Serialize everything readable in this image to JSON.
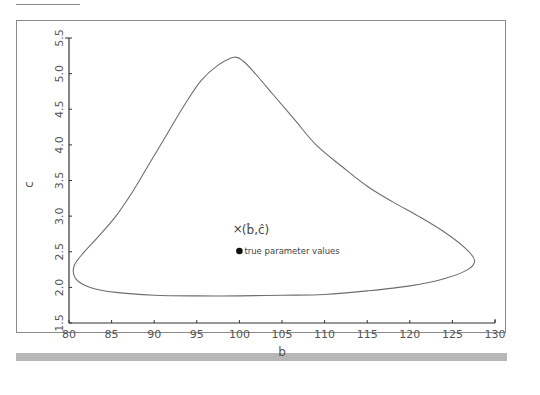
{
  "chart_data": {
    "type": "line",
    "title": "",
    "xlabel": "b",
    "ylabel": "c",
    "xlim": [
      80,
      130
    ],
    "ylim": [
      1.5,
      5.5
    ],
    "x_ticks": [
      "80",
      "85",
      "90",
      "95",
      "100",
      "105",
      "110",
      "115",
      "120",
      "125",
      "130"
    ],
    "y_ticks": [
      "1.5",
      "2.0",
      "2.5",
      "3.0",
      "3.5",
      "4.0",
      "4.5",
      "5.0",
      "5.5"
    ],
    "grid": false,
    "legend": "none",
    "series": [
      {
        "name": "confidence region",
        "kind": "closed-contour",
        "points": [
          [
            99.4,
            5.23
          ],
          [
            97.5,
            5.12
          ],
          [
            95.5,
            4.9
          ],
          [
            93.5,
            4.55
          ],
          [
            91.5,
            4.15
          ],
          [
            89.5,
            3.75
          ],
          [
            87.5,
            3.35
          ],
          [
            85.5,
            3.0
          ],
          [
            83.5,
            2.72
          ],
          [
            81.8,
            2.5
          ],
          [
            80.6,
            2.3
          ],
          [
            80.8,
            2.12
          ],
          [
            82.5,
            2.0
          ],
          [
            85.5,
            1.93
          ],
          [
            90.0,
            1.89
          ],
          [
            95.0,
            1.88
          ],
          [
            100.0,
            1.88
          ],
          [
            105.0,
            1.89
          ],
          [
            110.0,
            1.9
          ],
          [
            115.0,
            1.95
          ],
          [
            120.0,
            2.02
          ],
          [
            124.0,
            2.12
          ],
          [
            126.8,
            2.25
          ],
          [
            127.6,
            2.38
          ],
          [
            126.5,
            2.55
          ],
          [
            124.0,
            2.78
          ],
          [
            121.0,
            3.0
          ],
          [
            118.0,
            3.2
          ],
          [
            115.0,
            3.42
          ],
          [
            112.0,
            3.7
          ],
          [
            109.0,
            4.0
          ],
          [
            106.5,
            4.35
          ],
          [
            104.0,
            4.7
          ],
          [
            102.0,
            4.98
          ],
          [
            100.5,
            5.17
          ],
          [
            99.4,
            5.23
          ]
        ]
      }
    ],
    "annotations": [
      {
        "marker": "×",
        "label": "(b̂,ĉ)",
        "x": 99.7,
        "y": 2.82
      },
      {
        "marker": "●",
        "label": "true parameter values",
        "x": 100.0,
        "y": 2.51
      }
    ]
  },
  "labels": {
    "x_axis_title": "b",
    "y_axis_title": "c",
    "estimate_marker": "×",
    "estimate_label": "(b̂,ĉ)",
    "true_label": "true parameter values"
  }
}
